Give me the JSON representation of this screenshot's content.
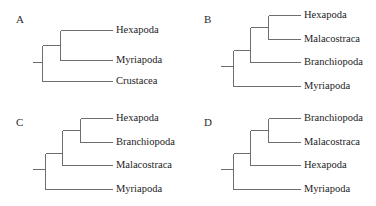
{
  "figure": {
    "width": 376,
    "height": 206,
    "background": "#ffffff",
    "line_color": "#6e6e6e",
    "text_color": "#232323",
    "letter_color": "#2b2b2b"
  },
  "panels": [
    {
      "id": "A",
      "letter": "A",
      "letter_x": 16,
      "letter_y": 14,
      "origin_x": 0,
      "origin_y": 0,
      "root_stub_x": 32,
      "root_x": 42,
      "tip_x": 112,
      "label_x": 116,
      "tips": [
        {
          "name": "Hexapoda",
          "y": 30
        },
        {
          "name": "Myriapoda",
          "y": 60
        },
        {
          "name": "Crustacea",
          "y": 81
        }
      ],
      "nodes": [
        {
          "name": "root",
          "x": 42,
          "y_top": 45,
          "y_bottom": 81,
          "stub_y": 62
        },
        {
          "name": "hexapoda-myriapoda-clade",
          "x": 60,
          "y_top": 30,
          "y_bottom": 60
        }
      ],
      "connectors": [
        {
          "from_x": 42,
          "to_x": 60,
          "y": 45
        },
        {
          "from_x": 42,
          "to_x": 112,
          "y": 81
        },
        {
          "from_x": 60,
          "to_x": 112,
          "y": 30
        },
        {
          "from_x": 60,
          "to_x": 112,
          "y": 60
        }
      ]
    },
    {
      "id": "B",
      "letter": "B",
      "letter_x": 16,
      "letter_y": 14,
      "origin_x": 188,
      "origin_y": 0,
      "root_stub_x": 32,
      "root_x": 45,
      "tip_x": 112,
      "label_x": 116,
      "tips": [
        {
          "name": "Hexapoda",
          "y": 15
        },
        {
          "name": "Malacostraca",
          "y": 39
        },
        {
          "name": "Branchiopoda",
          "y": 62
        },
        {
          "name": "Myriapoda",
          "y": 86
        }
      ],
      "nodes": [
        {
          "name": "root",
          "x": 45,
          "y_top": 50,
          "y_bottom": 86,
          "stub_y": 66
        },
        {
          "name": "pancrustacea-clade",
          "x": 62,
          "y_top": 27,
          "y_bottom": 62
        },
        {
          "name": "hexapoda-malacostraca-clade",
          "x": 80,
          "y_top": 15,
          "y_bottom": 39
        }
      ],
      "connectors": [
        {
          "from_x": 45,
          "to_x": 62,
          "y": 50
        },
        {
          "from_x": 45,
          "to_x": 112,
          "y": 86
        },
        {
          "from_x": 62,
          "to_x": 80,
          "y": 27
        },
        {
          "from_x": 62,
          "to_x": 112,
          "y": 62
        },
        {
          "from_x": 80,
          "to_x": 112,
          "y": 15
        },
        {
          "from_x": 80,
          "to_x": 112,
          "y": 39
        }
      ]
    },
    {
      "id": "C",
      "letter": "C",
      "letter_x": 16,
      "letter_y": 14,
      "origin_x": 0,
      "origin_y": 103,
      "root_stub_x": 32,
      "root_x": 45,
      "tip_x": 112,
      "label_x": 116,
      "tips": [
        {
          "name": "Hexapoda",
          "y": 15
        },
        {
          "name": "Branchiopoda",
          "y": 39
        },
        {
          "name": "Malacostraca",
          "y": 62
        },
        {
          "name": "Myriapoda",
          "y": 86
        }
      ],
      "nodes": [
        {
          "name": "root",
          "x": 45,
          "y_top": 50,
          "y_bottom": 86,
          "stub_y": 66
        },
        {
          "name": "pancrustacea-clade",
          "x": 62,
          "y_top": 27,
          "y_bottom": 62
        },
        {
          "name": "hexapoda-branchiopoda-clade",
          "x": 80,
          "y_top": 15,
          "y_bottom": 39
        }
      ],
      "connectors": [
        {
          "from_x": 45,
          "to_x": 62,
          "y": 50
        },
        {
          "from_x": 45,
          "to_x": 112,
          "y": 86
        },
        {
          "from_x": 62,
          "to_x": 80,
          "y": 27
        },
        {
          "from_x": 62,
          "to_x": 112,
          "y": 62
        },
        {
          "from_x": 80,
          "to_x": 112,
          "y": 15
        },
        {
          "from_x": 80,
          "to_x": 112,
          "y": 39
        }
      ]
    },
    {
      "id": "D",
      "letter": "D",
      "letter_x": 16,
      "letter_y": 14,
      "origin_x": 188,
      "origin_y": 103,
      "root_stub_x": 32,
      "root_x": 45,
      "tip_x": 112,
      "label_x": 116,
      "tips": [
        {
          "name": "Branchiopoda",
          "y": 15
        },
        {
          "name": "Malacostraca",
          "y": 39
        },
        {
          "name": "Hexapoda",
          "y": 62
        },
        {
          "name": "Myriapoda",
          "y": 86
        }
      ],
      "nodes": [
        {
          "name": "root",
          "x": 45,
          "y_top": 50,
          "y_bottom": 86,
          "stub_y": 66
        },
        {
          "name": "crustacea-hexapoda-clade",
          "x": 62,
          "y_top": 27,
          "y_bottom": 62
        },
        {
          "name": "branchiopoda-malacostraca-clade",
          "x": 80,
          "y_top": 15,
          "y_bottom": 39
        }
      ],
      "connectors": [
        {
          "from_x": 45,
          "to_x": 62,
          "y": 50
        },
        {
          "from_x": 45,
          "to_x": 112,
          "y": 86
        },
        {
          "from_x": 62,
          "to_x": 80,
          "y": 27
        },
        {
          "from_x": 62,
          "to_x": 112,
          "y": 62
        },
        {
          "from_x": 80,
          "to_x": 112,
          "y": 15
        },
        {
          "from_x": 80,
          "to_x": 112,
          "y": 39
        }
      ]
    }
  ]
}
